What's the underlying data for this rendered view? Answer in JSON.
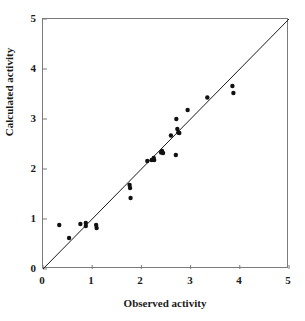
{
  "chart_data": {
    "type": "scatter",
    "title": "",
    "xlabel": "Observed activity",
    "ylabel": "Calculated activity",
    "xlim": [
      0,
      5
    ],
    "ylim": [
      0,
      5
    ],
    "xticks": [
      "0",
      "1",
      "2",
      "3",
      "4",
      "5"
    ],
    "yticks": [
      "0",
      "1",
      "2",
      "3",
      "4",
      "5"
    ],
    "xtick_values": [
      0,
      1,
      2,
      3,
      4,
      5
    ],
    "ytick_values": [
      0,
      1,
      2,
      3,
      4,
      5
    ],
    "grid": false,
    "legend": false,
    "legend_position": "none",
    "marker": "filled-circle",
    "marker_color": "#111111",
    "marker_size_px": 4.0,
    "frame_color": "#7b7b7b",
    "reference_line": {
      "name": "identity-line",
      "type": "line",
      "equation": "y = x",
      "x": [
        0,
        5
      ],
      "y": [
        0,
        5
      ],
      "color": "#1a1a1a",
      "width_px": 1.0
    },
    "series": [
      {
        "name": "Observed vs calculated activity",
        "points": [
          [
            0.33,
            0.88
          ],
          [
            0.53,
            0.62
          ],
          [
            0.76,
            0.9
          ],
          [
            0.87,
            0.92
          ],
          [
            0.87,
            0.86
          ],
          [
            1.08,
            0.88
          ],
          [
            1.09,
            0.82
          ],
          [
            1.76,
            1.68
          ],
          [
            1.77,
            1.62
          ],
          [
            1.78,
            1.42
          ],
          [
            2.12,
            2.16
          ],
          [
            2.21,
            2.18
          ],
          [
            2.25,
            2.22
          ],
          [
            2.26,
            2.18
          ],
          [
            2.4,
            2.33
          ],
          [
            2.42,
            2.36
          ],
          [
            2.44,
            2.32
          ],
          [
            2.6,
            2.67
          ],
          [
            2.7,
            2.28
          ],
          [
            2.71,
            3.0
          ],
          [
            2.73,
            2.8
          ],
          [
            2.75,
            2.73
          ],
          [
            2.77,
            2.72
          ],
          [
            2.94,
            3.18
          ],
          [
            3.34,
            3.43
          ],
          [
            3.85,
            3.66
          ],
          [
            3.87,
            3.52
          ]
        ]
      }
    ]
  },
  "axes": {
    "x_tick_labels": [
      "0",
      "1",
      "2",
      "3",
      "4",
      "5"
    ],
    "y_tick_labels": [
      "0",
      "1",
      "2",
      "3",
      "4",
      "5"
    ],
    "x_title": "Observed activity",
    "y_title": "Calculated activity"
  }
}
